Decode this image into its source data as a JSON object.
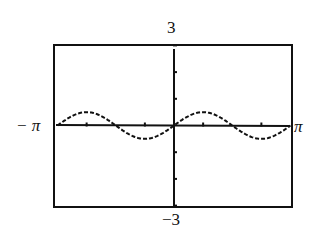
{
  "chart_data": {
    "type": "line",
    "title": "",
    "xlabel": "",
    "ylabel": "",
    "function": "y = 0.5 sin(2x)",
    "xlim": [
      "-π",
      "π"
    ],
    "xlim_numeric": [
      -3.14159,
      3.14159
    ],
    "ylim": [
      -3,
      3
    ],
    "grid": false,
    "legend": null,
    "window_labels": {
      "xmin": "−π",
      "xmax": "π",
      "ymin": "−3",
      "ymax": "3"
    },
    "x_ticks": [
      "-3π/4",
      "-π/4",
      "π/4",
      "3π/4"
    ],
    "y_ticks": [
      -3,
      -2,
      -1,
      1,
      2,
      3
    ],
    "series": [
      {
        "name": "y = 0.5 sin(2x)",
        "x": [
          -3.1416,
          -2.3562,
          -1.5708,
          -0.7854,
          0,
          0.7854,
          1.5708,
          2.3562,
          3.1416
        ],
        "values": [
          0,
          0.5,
          0,
          -0.5,
          0,
          0.5,
          0,
          -0.5,
          0
        ]
      }
    ]
  },
  "labels": {
    "y_max": "3",
    "y_min": "−3",
    "x_min": "− π",
    "x_max": "π"
  },
  "style": {
    "ink": "#111111",
    "background": "#ffffff"
  }
}
